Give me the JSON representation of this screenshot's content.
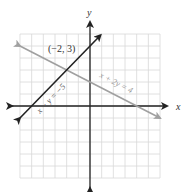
{
  "chart_data": {
    "type": "line",
    "title": "",
    "xlabel": "x",
    "ylabel": "y",
    "xlim": [
      -6,
      6
    ],
    "ylim": [
      -6,
      6
    ],
    "grid": true,
    "grid_step": 1,
    "series": [
      {
        "name": "x − y = −5",
        "equation": "x - y = -5",
        "color": "#222222",
        "points": [
          [
            -6,
            -1
          ],
          [
            0.9,
            5.9
          ]
        ]
      },
      {
        "name": "x + 2y = 4",
        "equation": "x + 2y = 4",
        "color": "#a0a0a0",
        "points": [
          [
            -6,
            5
          ],
          [
            6,
            -1
          ]
        ]
      }
    ],
    "annotations": [
      {
        "text": "(−2, 3)",
        "x": -2,
        "y": 3,
        "note": "intersection point"
      }
    ]
  },
  "labels": {
    "x_axis": "x",
    "y_axis": "y",
    "line1": "x − y = −5",
    "line2": "x + 2y = 4",
    "point": "(−2, 3)"
  },
  "colors": {
    "grid": "#d8d8d8",
    "axes": "#222222",
    "line1": "#222222",
    "line2": "#a0a0a0"
  }
}
